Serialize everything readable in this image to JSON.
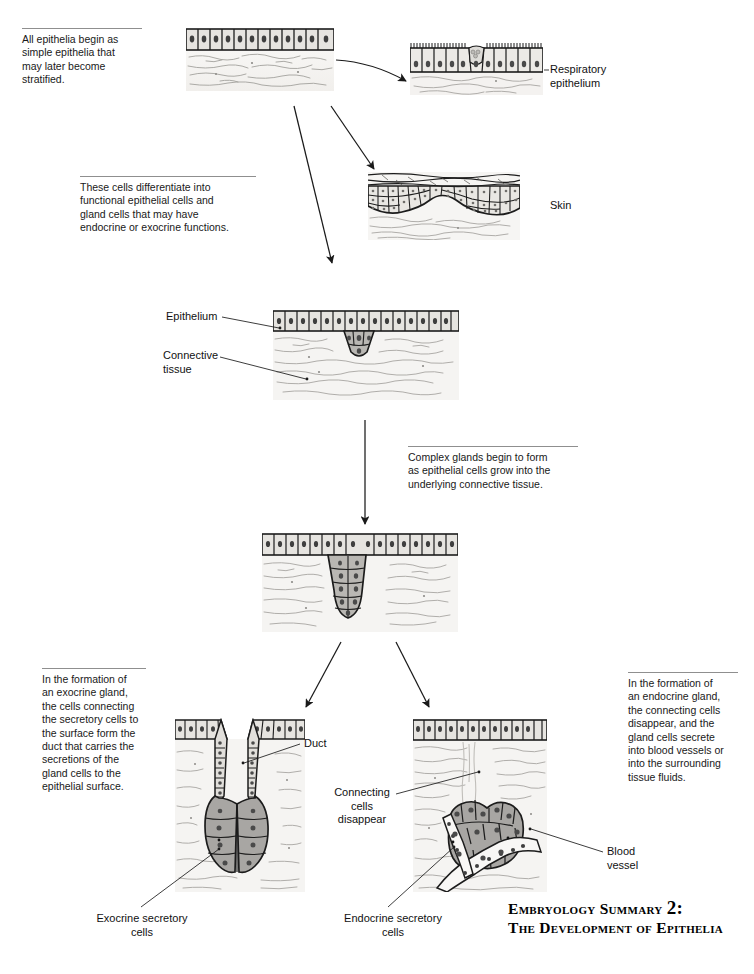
{
  "page": {
    "width": 754,
    "height": 974,
    "background": "#ffffff",
    "ink": "#111111",
    "rule_color": "#8f8f8f",
    "cell_fill": "#e3e1dd",
    "gland_fill": "#a8a6a3",
    "nucleus_fill": "#4a4a4a",
    "connective_fill": "#f4f3f1",
    "fiber_color": "#9a9894"
  },
  "notes": [
    {
      "id": "note-begin",
      "text": "All epithelia begin as\nsimple epithelia that\nmay later become\nstratified.",
      "x": 22,
      "y": 28,
      "width": 116
    },
    {
      "id": "note-differentiate",
      "text": "These cells differentiate into\nfunctional epithelial cells and\ngland cells that may have\nendocrine or exocrine functions.",
      "x": 80,
      "y": 176,
      "width": 172
    },
    {
      "id": "note-complex-glands",
      "text": "Complex glands begin to form\nas epithelial cells grow into the\nunderlying connective tissue.",
      "x": 408,
      "y": 446,
      "width": 166
    },
    {
      "id": "note-exocrine",
      "text": "In the formation of\nan exocrine gland,\nthe cells connecting\nthe secretory cells to\nthe surface form the\nduct that carries the\nsecretions of the\ngland cells to the\nepithelial surface.",
      "x": 42,
      "y": 668,
      "width": 100
    },
    {
      "id": "note-endocrine",
      "text": "In the formation of\nan endocrine gland,\nthe connecting cells\ndisappear, and the\ngland cells secrete\ninto blood vessels or\ninto the surrounding\ntissue fluids.",
      "x": 628,
      "y": 672,
      "width": 106
    }
  ],
  "labels": [
    {
      "id": "label-respiratory-epithelium",
      "text": "Respiratory\n  epithelium",
      "x": 550,
      "y": 64,
      "align": "left"
    },
    {
      "id": "label-skin",
      "text": "Skin",
      "x": 550,
      "y": 200,
      "align": "left"
    },
    {
      "id": "label-epithelium",
      "text": "Epithelium",
      "x": 166,
      "y": 310,
      "align": "left"
    },
    {
      "id": "label-connective-tissue",
      "text": "Connective\n   tissue",
      "x": 163,
      "y": 348,
      "align": "left"
    },
    {
      "id": "label-duct",
      "text": "Duct",
      "x": 303,
      "y": 740,
      "align": "left"
    },
    {
      "id": "label-connecting-cells-disappear",
      "text": "Connecting\ncells\ndisappear",
      "x": 338,
      "y": 785,
      "align": "center"
    },
    {
      "id": "label-blood-vessel",
      "text": "Blood\nvessel",
      "x": 606,
      "y": 846,
      "align": "left"
    },
    {
      "id": "label-exocrine-secretory-cells",
      "text": "Exocrine secretory\ncells",
      "x": 92,
      "y": 912,
      "align": "center"
    },
    {
      "id": "label-endocrine-secretory-cells",
      "text": "Endocrine secretory\ncells",
      "x": 338,
      "y": 912,
      "align": "center"
    }
  ],
  "caption": {
    "line1_prefix": "Embryology Summary ",
    "line1_number": "2:",
    "line2": "The Development of Epithelia",
    "x": 508,
    "y": 900
  },
  "figures": [
    {
      "id": "figure-simple-epithelium",
      "name": "simple-epithelium",
      "x": 186,
      "y": 27,
      "width": 148,
      "height": 64
    },
    {
      "id": "figure-respiratory-epithelium",
      "name": "respiratory-epithelium",
      "x": 410,
      "y": 43,
      "width": 133,
      "height": 50
    },
    {
      "id": "figure-skin",
      "name": "skin",
      "x": 368,
      "y": 172,
      "width": 152,
      "height": 67
    },
    {
      "id": "figure-early-gland",
      "name": "early-gland-invagination",
      "x": 273,
      "y": 310,
      "width": 185,
      "height": 87
    },
    {
      "id": "figure-growing-gland",
      "name": "growing-gland",
      "x": 262,
      "y": 532,
      "width": 195,
      "height": 98
    },
    {
      "id": "figure-exocrine-gland",
      "name": "exocrine-gland",
      "x": 175,
      "y": 718,
      "width": 130,
      "height": 172
    },
    {
      "id": "figure-endocrine-gland",
      "name": "endocrine-gland",
      "x": 413,
      "y": 718,
      "width": 134,
      "height": 172
    }
  ],
  "arrows": [
    {
      "id": "arrow-simple-to-respiratory",
      "from": [
        336,
        62
      ],
      "to": [
        408,
        80
      ],
      "curve": true
    },
    {
      "id": "arrow-simple-to-skin",
      "from": [
        331,
        105
      ],
      "to": [
        376,
        168
      ]
    },
    {
      "id": "arrow-simple-to-early-gland",
      "from": [
        296,
        105
      ],
      "to": [
        331,
        262
      ]
    },
    {
      "id": "arrow-early-to-growing",
      "from": [
        365,
        418
      ],
      "to": [
        365,
        524
      ]
    },
    {
      "id": "arrow-growing-to-exocrine",
      "from": [
        340,
        640
      ],
      "to": [
        305,
        706
      ]
    },
    {
      "id": "arrow-growing-to-endocrine",
      "from": [
        397,
        640
      ],
      "to": [
        428,
        706
      ]
    }
  ],
  "leaders": [
    {
      "id": "leader-respiratory",
      "points": [
        [
          543,
          70
        ],
        [
          548,
          70
        ]
      ]
    },
    {
      "id": "leader-epithelium",
      "points": [
        [
          224,
          316
        ],
        [
          280,
          327
        ]
      ]
    },
    {
      "id": "leader-connective",
      "points": [
        [
          222,
          356
        ],
        [
          307,
          378
        ]
      ]
    },
    {
      "id": "leader-duct",
      "points": [
        [
          299,
          744
        ],
        [
          243,
          762
        ]
      ]
    },
    {
      "id": "leader-connecting",
      "points": [
        [
          395,
          794
        ],
        [
          479,
          772
        ]
      ]
    },
    {
      "id": "leader-blood",
      "points": [
        [
          602,
          852
        ],
        [
          530,
          828
        ]
      ]
    },
    {
      "id": "leader-exocrine",
      "points": [
        [
          140,
          906
        ],
        [
          219,
          848
        ]
      ]
    },
    {
      "id": "leader-endocrine",
      "points": [
        [
          387,
          906
        ],
        [
          455,
          846
        ]
      ]
    }
  ]
}
